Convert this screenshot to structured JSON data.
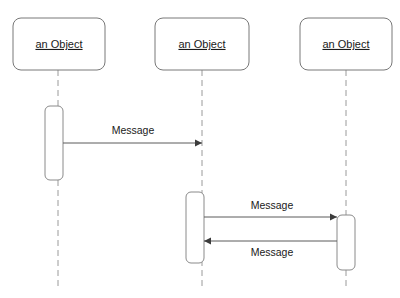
{
  "diagram": {
    "type": "uml-sequence-diagram",
    "canvas": {
      "width": 400,
      "height": 298,
      "background": "#ffffff"
    },
    "colors": {
      "box_stroke": "#787878",
      "lifeline_stroke": "#9a9a9a",
      "activation_stroke": "#8a8a8a",
      "message_stroke": "#5a5a5a",
      "arrow_fill": "#3c3c3c",
      "text": "#1a1a1a",
      "fill": "#ffffff"
    },
    "lifelines": [
      {
        "id": "lifeline-1",
        "label": "an Object",
        "box": {
          "x": 13,
          "y": 18,
          "w": 92,
          "h": 52,
          "r": 8
        },
        "axis_x": 58,
        "line": {
          "y1": 70,
          "y2": 288
        },
        "activations": [
          {
            "id": "activation-1",
            "x": 45,
            "y": 106,
            "w": 18,
            "h": 74,
            "r": 5
          }
        ]
      },
      {
        "id": "lifeline-2",
        "label": "an Object",
        "box": {
          "x": 155,
          "y": 18,
          "w": 94,
          "h": 52,
          "r": 8
        },
        "axis_x": 202,
        "line": {
          "y1": 70,
          "y2": 288
        },
        "activations": [
          {
            "id": "activation-2",
            "x": 186,
            "y": 192,
            "w": 18,
            "h": 71,
            "r": 5
          }
        ]
      },
      {
        "id": "lifeline-3",
        "label": "an Object",
        "box": {
          "x": 300,
          "y": 18,
          "w": 92,
          "h": 52,
          "r": 8
        },
        "axis_x": 346,
        "line": {
          "y1": 70,
          "y2": 288
        },
        "activations": [
          {
            "id": "activation-3",
            "x": 337,
            "y": 215,
            "w": 18,
            "h": 55,
            "r": 5
          }
        ]
      }
    ],
    "messages": [
      {
        "id": "message-1",
        "label": "Message",
        "direction": "right",
        "x1": 63,
        "x2": 202,
        "y": 143,
        "label_x": 133,
        "label_y": 131
      },
      {
        "id": "message-2",
        "label": "Message",
        "direction": "right",
        "x1": 204,
        "x2": 337,
        "y": 217,
        "label_x": 272,
        "label_y": 206
      },
      {
        "id": "message-3",
        "label": "Message",
        "direction": "left",
        "x1": 337,
        "x2": 204,
        "y": 241,
        "label_x": 272,
        "label_y": 253
      }
    ]
  }
}
